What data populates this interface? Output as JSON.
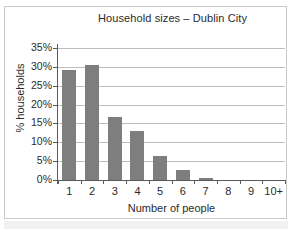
{
  "chart_data": {
    "type": "bar",
    "title": "Household sizes – Dublin City",
    "xlabel": "Number of people",
    "ylabel": "% households",
    "categories": [
      "1",
      "2",
      "3",
      "4",
      "5",
      "6",
      "7",
      "8",
      "9",
      "10+"
    ],
    "values": [
      29.3,
      30.6,
      16.7,
      13.0,
      6.4,
      2.6,
      0.6,
      0.2,
      0.1,
      0.1
    ],
    "ylim": [
      0,
      35
    ],
    "ytick_values": [
      0,
      5,
      10,
      15,
      20,
      25,
      30,
      35
    ],
    "ytick_labels": [
      "0%",
      "5%",
      "10%",
      "15%",
      "20%",
      "25%",
      "30%",
      "35%"
    ],
    "grid": true,
    "legend": null,
    "bar_color": "#7e7e7e",
    "axis_color": "#5a5a5a",
    "gridline_color": "#bdbdbd",
    "background_color": "#ffffff",
    "text_color": "#2b2b2b"
  }
}
